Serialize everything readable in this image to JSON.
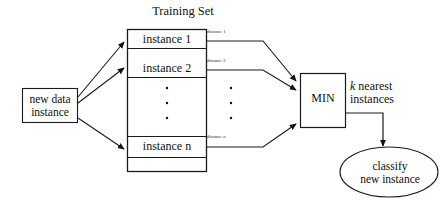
{
  "diagram": {
    "title": "Training Set",
    "source_node": {
      "line1": "new data",
      "line2": "instance"
    },
    "training_set": {
      "rows": [
        {
          "label": "instance 1",
          "kind": "instance"
        },
        {
          "label": "instance 2",
          "kind": "instance"
        },
        {
          "label": "",
          "kind": "ellipsis"
        },
        {
          "label": "instance n",
          "kind": "instance"
        },
        {
          "label": "",
          "kind": "blank"
        }
      ]
    },
    "distance_labels": [
      "distance 1",
      "distance 2",
      "distance n"
    ],
    "min_node": {
      "label": "MIN"
    },
    "edge_label": {
      "k": "k",
      "rest": " nearest",
      "line2": "instances"
    },
    "result_node": {
      "line1": "classify",
      "line2": "new instance"
    },
    "colors": {
      "stroke": "#1a1a1a",
      "stroke_light": "#444444",
      "text": "#111111",
      "background": "#ffffff"
    }
  }
}
